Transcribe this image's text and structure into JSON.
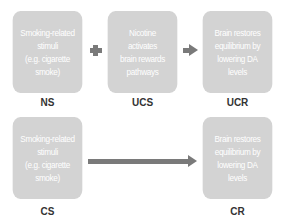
{
  "colors": {
    "box_fill": "#d3d3d3",
    "box_text": "#ffffff",
    "connector": "#7a7a7a",
    "label_text": "#333333"
  },
  "top_row": {
    "ns": {
      "text": "Smoking-related\nstimuli\n(e.g. cigarette smoke)",
      "label": "NS"
    },
    "ucs": {
      "text": "Nicotine\nactivates\nbrain rewards\npathways",
      "label": "UCS"
    },
    "ucr": {
      "text": "Brain restores\nequilibrium by\nlowering DA\nlevels",
      "label": "UCR"
    },
    "connector_1": "plus-icon",
    "connector_2": "arrow-right-icon"
  },
  "bottom_row": {
    "cs": {
      "text": "Smoking-related\nstimuli\n(e.g. cigarette smoke)",
      "label": "CS"
    },
    "cr": {
      "text": "Brain restores\nequilibrium by\nlowering DA\nlevels",
      "label": "CR"
    },
    "connector": "long-arrow-right-icon"
  }
}
